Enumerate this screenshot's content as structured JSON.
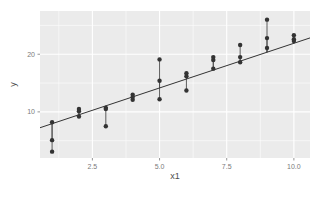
{
  "chart_data": {
    "type": "scatter",
    "title": "",
    "subtitle": "",
    "xlabel": "x1",
    "ylabel": "y",
    "xlim": [
      0.55,
      10.6
    ],
    "ylim": [
      2.0,
      27.5
    ],
    "xticks": [
      2.5,
      5.0,
      7.5,
      10.0
    ],
    "xtick_labels": [
      "2.5",
      "5.0",
      "7.5",
      "10.0"
    ],
    "yticks": [
      10,
      20
    ],
    "ytick_labels": [
      "10",
      "20"
    ],
    "grid": true,
    "grid_color": "#ffffff",
    "panel_background": "#ebebeb",
    "legend": null,
    "legend_position": "none",
    "point_color": "#333333",
    "point_size": 2.2,
    "segment_color": "#4d4d4d",
    "line_color": "#333333",
    "annotations": [
      "Each point is connected by a vertical residual segment to the fitted regression line."
    ],
    "fit_line": {
      "type": "linear",
      "slope": 1.55,
      "intercept": 6.4,
      "x_start": 0.55,
      "x_end": 10.6
    },
    "x": [
      1,
      1,
      1,
      2,
      2,
      2,
      3,
      3,
      3,
      4,
      4,
      4,
      5,
      5,
      5,
      6,
      6,
      6,
      7,
      7,
      7,
      8,
      8,
      8,
      9,
      9,
      9,
      10,
      10,
      10
    ],
    "y": [
      8.2,
      5.1,
      3.1,
      10.5,
      10.1,
      9.2,
      10.7,
      10.5,
      7.5,
      13.0,
      12.6,
      12.1,
      19.1,
      15.4,
      12.2,
      16.7,
      16.2,
      13.7,
      19.5,
      19.0,
      17.5,
      21.6,
      19.5,
      18.6,
      26.0,
      22.8,
      21.1,
      23.3,
      22.6,
      22.3
    ],
    "series": [
      {
        "name": "observations",
        "points": [
          {
            "x": 1,
            "y": 8.2
          },
          {
            "x": 1,
            "y": 5.1
          },
          {
            "x": 1,
            "y": 3.1
          },
          {
            "x": 2,
            "y": 10.5
          },
          {
            "x": 2,
            "y": 10.1
          },
          {
            "x": 2,
            "y": 9.2
          },
          {
            "x": 3,
            "y": 10.7
          },
          {
            "x": 3,
            "y": 10.5
          },
          {
            "x": 3,
            "y": 7.5
          },
          {
            "x": 4,
            "y": 13.0
          },
          {
            "x": 4,
            "y": 12.6
          },
          {
            "x": 4,
            "y": 12.1
          },
          {
            "x": 5,
            "y": 19.1
          },
          {
            "x": 5,
            "y": 15.4
          },
          {
            "x": 5,
            "y": 12.2
          },
          {
            "x": 6,
            "y": 16.7
          },
          {
            "x": 6,
            "y": 16.2
          },
          {
            "x": 6,
            "y": 13.7
          },
          {
            "x": 7,
            "y": 19.5
          },
          {
            "x": 7,
            "y": 19.0
          },
          {
            "x": 7,
            "y": 17.5
          },
          {
            "x": 8,
            "y": 21.6
          },
          {
            "x": 8,
            "y": 19.5
          },
          {
            "x": 8,
            "y": 18.6
          },
          {
            "x": 9,
            "y": 26.0
          },
          {
            "x": 9,
            "y": 22.8
          },
          {
            "x": 9,
            "y": 21.1
          },
          {
            "x": 10,
            "y": 23.3
          },
          {
            "x": 10,
            "y": 22.6
          },
          {
            "x": 10,
            "y": 22.3
          }
        ]
      }
    ]
  }
}
